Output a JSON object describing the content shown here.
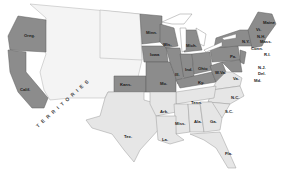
{
  "map": {
    "subject": "United States during the Civil War",
    "legend_colors": {
      "union_states": "#8c8c8c",
      "confederate_states": "#e6e6e6",
      "territories": "#f4f4f4"
    },
    "territories_label": "TERRITORIES",
    "union_labels": {
      "oreg": "Oreg.",
      "calif": "Calif.",
      "kans": "Kans.",
      "minn": "Minn.",
      "wis": "Wis.",
      "iowa": "Iowa",
      "mich": "Mich.",
      "ill": "Ill.",
      "ind": "Ind.",
      "ohio": "Ohio",
      "mo": "Mo.",
      "ky": "Ky.",
      "wva": "W.Va.",
      "pa": "Pa.",
      "ny": "N.Y.",
      "vt": "Vt.",
      "nh": "N.H.",
      "maine": "Maine",
      "mass": "Mass.",
      "conn": "Conn.",
      "ri": "R.I.",
      "nj": "N.J.",
      "del": "Del.",
      "md": "Md."
    },
    "confederate_labels": {
      "va": "Va.",
      "nc": "N.C.",
      "sc": "S.C.",
      "tenn": "Tenn.",
      "ark": "Ark.",
      "miss": "Miss.",
      "ala": "Ala.",
      "ga": "Ga.",
      "la": "La.",
      "tex": "Tex.",
      "fla": "Fla."
    }
  }
}
